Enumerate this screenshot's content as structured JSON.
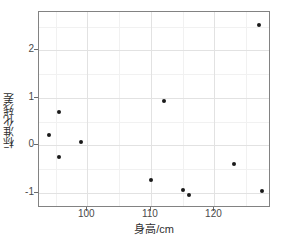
{
  "chart_data": {
    "type": "scatter",
    "title": "",
    "xlabel": "身高/cm",
    "ylabel": "标准化残差",
    "xlim": [
      92.4,
      128.9
    ],
    "ylim": [
      -1.32,
      2.81
    ],
    "xticks": [
      100,
      110,
      120
    ],
    "xtick_labels": [
      "100",
      "110",
      "120"
    ],
    "yticks": [
      -1,
      0,
      1,
      2
    ],
    "ytick_labels": [
      "-1",
      "0",
      "1",
      "2"
    ],
    "x_minor_ticks": [
      95,
      105,
      115,
      125
    ],
    "y_minor_ticks": [
      -0.5,
      0.5,
      1.5,
      2.5
    ],
    "grid": true,
    "legend": "none",
    "point_color": "#1a1a1a",
    "panel_background": "#ffffff",
    "grid_major_color": "#e2e2e2",
    "grid_minor_color": "#f1f1f1",
    "x": [
      94.0,
      95.5,
      95.5,
      99.0,
      110.0,
      112.0,
      115.0,
      116.0,
      123.0,
      127.0,
      127.5
    ],
    "y": [
      0.22,
      0.7,
      -0.25,
      0.07,
      -0.72,
      0.93,
      -0.93,
      -1.04,
      -0.39,
      2.54,
      -0.97
    ],
    "points": [
      {
        "x": 94.0,
        "y": 0.22
      },
      {
        "x": 95.5,
        "y": 0.7
      },
      {
        "x": 95.5,
        "y": -0.25
      },
      {
        "x": 99.0,
        "y": 0.07
      },
      {
        "x": 110.0,
        "y": -0.72
      },
      {
        "x": 112.0,
        "y": 0.93
      },
      {
        "x": 115.0,
        "y": -0.93
      },
      {
        "x": 116.0,
        "y": -1.04
      },
      {
        "x": 123.0,
        "y": -0.39
      },
      {
        "x": 127.0,
        "y": 2.54
      },
      {
        "x": 127.5,
        "y": -0.97
      }
    ]
  }
}
